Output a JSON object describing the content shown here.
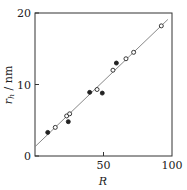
{
  "chart_data": {
    "type": "scatter",
    "title": "",
    "xlabel": "R",
    "ylabel": "r_h / nm",
    "ylabel_main": "r",
    "ylabel_sub": "h",
    "ylabel_unit": " / nm",
    "xlim": [
      0,
      100
    ],
    "ylim": [
      0,
      20
    ],
    "xticks": [
      0,
      50,
      100
    ],
    "yticks": [
      0,
      10,
      20
    ],
    "xtick_labels": [
      "50",
      "100"
    ],
    "ytick_labels": [
      "0",
      "10",
      "20"
    ],
    "grid": false,
    "legend": null,
    "series": [
      {
        "name": "open circles",
        "marker": "open-circle",
        "points": [
          {
            "x": 14.8,
            "y": 4.0
          },
          {
            "x": 23.1,
            "y": 5.6
          },
          {
            "x": 25.3,
            "y": 5.9
          },
          {
            "x": 45.3,
            "y": 9.3
          },
          {
            "x": 56.9,
            "y": 12.0
          },
          {
            "x": 66.4,
            "y": 13.6
          },
          {
            "x": 72.0,
            "y": 14.5
          },
          {
            "x": 92.2,
            "y": 18.2
          }
        ]
      },
      {
        "name": "filled circles",
        "marker": "filled-circle",
        "points": [
          {
            "x": 9.3,
            "y": 3.3
          },
          {
            "x": 24.3,
            "y": 4.8
          },
          {
            "x": 39.9,
            "y": 8.9
          },
          {
            "x": 49.1,
            "y": 8.8
          },
          {
            "x": 59.4,
            "y": 13.0
          }
        ]
      },
      {
        "name": "linear fit",
        "marker": "line",
        "points": [
          {
            "x": 0,
            "y": 1.3
          },
          {
            "x": 97,
            "y": 19.1
          }
        ]
      }
    ]
  },
  "colors": {
    "axis": "#333333",
    "marker": "#222222",
    "line": "#888888"
  }
}
